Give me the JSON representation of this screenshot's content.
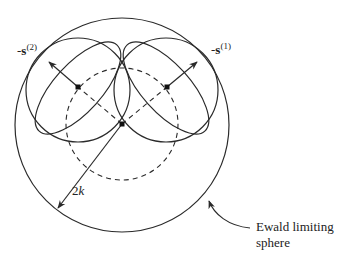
{
  "diagram": {
    "colors": {
      "stroke": "#2a2a2a",
      "background": "#ffffff"
    },
    "labels": {
      "s2": {
        "prefix": "-",
        "vector": "s",
        "superscript": "(2)"
      },
      "s1": {
        "prefix": "-",
        "vector": "s",
        "superscript": "(1)"
      },
      "radius": {
        "number": "2",
        "var": "k"
      },
      "callout_line1": "Ewald limiting",
      "callout_line2": "sphere"
    },
    "geometry": {
      "limiting_sphere": {
        "cx": 122,
        "cy": 125,
        "r": 107
      },
      "ewald_sphere_dashed": {
        "cx": 122,
        "cy": 124,
        "r": 56
      },
      "origin": {
        "x": 122,
        "y": 124
      },
      "reflection_spheres": [
        {
          "id": "s2",
          "cx": 78,
          "cy": 90,
          "r": 52,
          "dot": [
            78,
            87
          ]
        },
        {
          "id": "s1",
          "cx": 166,
          "cy": 90,
          "r": 52,
          "dot": [
            167,
            87
          ]
        }
      ]
    }
  }
}
